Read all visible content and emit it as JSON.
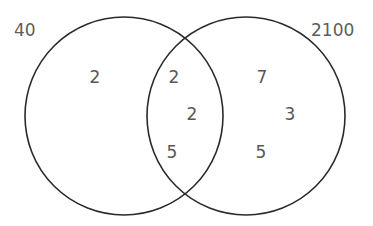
{
  "figure": {
    "type": "venn-diagram",
    "sets": 2,
    "background_color": "#ffffff",
    "stroke_color": "#2a2a2a",
    "text_color": "#575757"
  },
  "labels": {
    "left_set": "40",
    "right_set": "2100"
  },
  "chart_data": {
    "type": "diagram",
    "subtype": "venn",
    "title": "",
    "sets": [
      {
        "name": "40",
        "label_position": "top-left"
      },
      {
        "name": "2100",
        "label_position": "top-right"
      }
    ],
    "regions": [
      {
        "region": "left-only",
        "values": [
          "2"
        ]
      },
      {
        "region": "intersection",
        "values": [
          "2",
          "2",
          "5"
        ]
      },
      {
        "region": "right-only",
        "values": [
          "7",
          "3",
          "5"
        ]
      }
    ],
    "geometry": {
      "left_circle": {
        "cx": 124,
        "cy": 116,
        "r": 99
      },
      "right_circle": {
        "cx": 246,
        "cy": 116,
        "r": 99
      }
    }
  },
  "regions": {
    "left_only": {
      "items": [
        {
          "value": "2",
          "x": 95,
          "y": 77
        }
      ]
    },
    "intersection": {
      "items": [
        {
          "value": "2",
          "x": 174,
          "y": 77
        },
        {
          "value": "2",
          "x": 192,
          "y": 114
        },
        {
          "value": "5",
          "x": 172,
          "y": 152
        }
      ]
    },
    "right_only": {
      "items": [
        {
          "value": "7",
          "x": 262,
          "y": 77
        },
        {
          "value": "3",
          "x": 290,
          "y": 114
        },
        {
          "value": "5",
          "x": 261,
          "y": 152
        }
      ]
    }
  }
}
